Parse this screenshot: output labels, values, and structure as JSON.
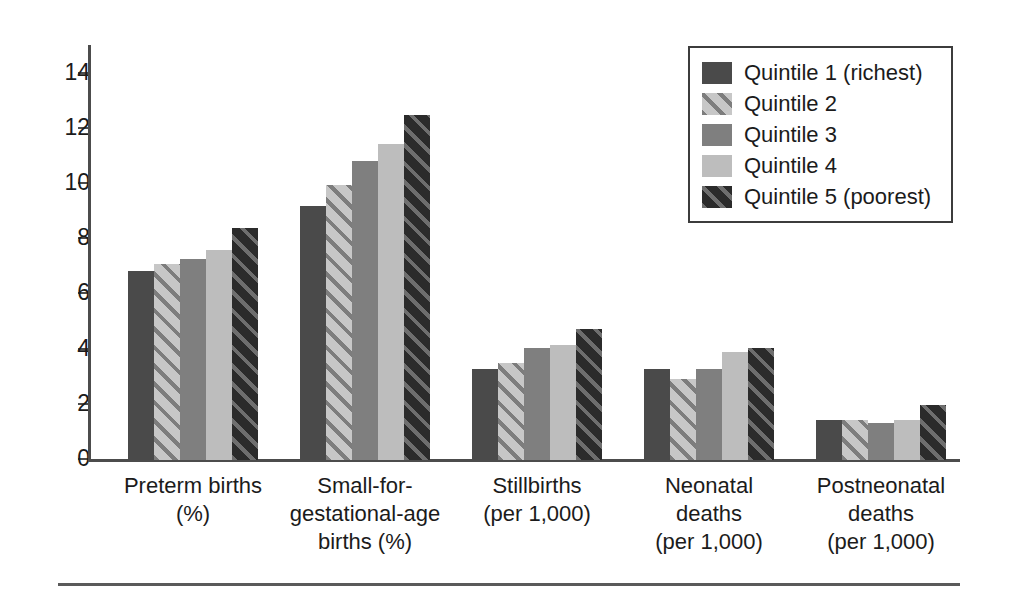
{
  "chart_data": {
    "type": "bar",
    "title": "",
    "subtitle": "",
    "xlabel": "",
    "ylabel": "",
    "ylim": [
      0,
      15
    ],
    "yticks": [
      0,
      2,
      4,
      6,
      8,
      10,
      12,
      14
    ],
    "ytick_labels": [
      "0",
      "2",
      "4",
      "6",
      "8",
      "10",
      "12",
      "14"
    ],
    "grid": false,
    "legend_position": "top-right",
    "categories": [
      "Preterm births\n(%)",
      "Small-for-\ngestational-age\nbirths (%)",
      "Stillbirths\n(per 1,000)",
      "Neonatal\ndeaths\n(per 1,000)",
      "Postneonatal\ndeaths\n(per 1,000)"
    ],
    "category_lines": [
      [
        "Preterm births",
        "(%)"
      ],
      [
        "Small-for-",
        "gestational-age",
        "births (%)"
      ],
      [
        "Stillbirths",
        "(per 1,000)"
      ],
      [
        "Neonatal",
        "deaths",
        "(per 1,000)"
      ],
      [
        "Postneonatal",
        "deaths",
        "(per 1,000)"
      ]
    ],
    "series": [
      {
        "name": "Quintile 1 (richest)",
        "key": "q1",
        "color": "#4a4a4a",
        "pattern": "solid",
        "values": [
          6.85,
          9.2,
          3.3,
          3.3,
          1.45
        ]
      },
      {
        "name": "Quintile 2",
        "key": "q2",
        "color": "#b9b9b9",
        "pattern": "diagonal-stripes",
        "values": [
          7.1,
          9.95,
          3.5,
          2.95,
          1.45
        ]
      },
      {
        "name": "Quintile 3",
        "key": "q3",
        "color": "#7f7f7f",
        "pattern": "solid",
        "values": [
          7.3,
          10.85,
          4.05,
          3.3,
          1.35
        ]
      },
      {
        "name": "Quintile 4",
        "key": "q4",
        "color": "#bdbdbd",
        "pattern": "solid",
        "values": [
          7.6,
          11.45,
          4.15,
          3.9,
          1.45
        ]
      },
      {
        "name": "Quintile 5 (poorest)",
        "key": "q5",
        "color": "#2f2f2f",
        "pattern": "diagonal-stripes",
        "values": [
          8.4,
          12.5,
          4.75,
          4.05,
          2.0
        ]
      }
    ]
  },
  "legend": {
    "entries": [
      {
        "label": "Quintile 1 (richest)",
        "key": "q1"
      },
      {
        "label": "Quintile 2",
        "key": "q2"
      },
      {
        "label": "Quintile 3",
        "key": "q3"
      },
      {
        "label": "Quintile 4",
        "key": "q4"
      },
      {
        "label": "Quintile 5 (poorest)",
        "key": "q5"
      }
    ]
  }
}
